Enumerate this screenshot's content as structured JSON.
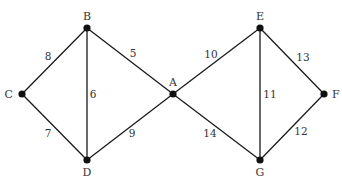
{
  "graph": {
    "nodes": [
      {
        "id": "A",
        "label": "A",
        "x": 173,
        "y": 94,
        "lx": 173,
        "ly": 86,
        "anchor": "middle"
      },
      {
        "id": "B",
        "label": "B",
        "x": 87,
        "y": 28,
        "lx": 87,
        "ly": 20,
        "anchor": "middle"
      },
      {
        "id": "C",
        "label": "C",
        "x": 22,
        "y": 94,
        "lx": 13,
        "ly": 98,
        "anchor": "end"
      },
      {
        "id": "D",
        "label": "D",
        "x": 87,
        "y": 160,
        "lx": 87,
        "ly": 176,
        "anchor": "middle"
      },
      {
        "id": "E",
        "label": "E",
        "x": 260,
        "y": 28,
        "lx": 260,
        "ly": 20,
        "anchor": "middle"
      },
      {
        "id": "F",
        "label": "F",
        "x": 324,
        "y": 94,
        "lx": 332,
        "ly": 98,
        "anchor": "start"
      },
      {
        "id": "G",
        "label": "G",
        "x": 260,
        "y": 160,
        "lx": 260,
        "ly": 176,
        "anchor": "middle"
      }
    ],
    "edges": [
      {
        "from": "C",
        "to": "B",
        "weight": "8",
        "wx": 48,
        "wy": 60
      },
      {
        "from": "B",
        "to": "A",
        "weight": "5",
        "wx": 133,
        "wy": 57
      },
      {
        "from": "B",
        "to": "D",
        "weight": "6",
        "wx": 93,
        "wy": 98
      },
      {
        "from": "C",
        "to": "D",
        "weight": "7",
        "wx": 48,
        "wy": 137
      },
      {
        "from": "D",
        "to": "A",
        "weight": "9",
        "wx": 132,
        "wy": 137
      },
      {
        "from": "A",
        "to": "E",
        "weight": "10",
        "wx": 211,
        "wy": 58
      },
      {
        "from": "E",
        "to": "G",
        "weight": "11",
        "wx": 270,
        "wy": 98
      },
      {
        "from": "E",
        "to": "F",
        "weight": "13",
        "wx": 303,
        "wy": 61
      },
      {
        "from": "A",
        "to": "G",
        "weight": "14",
        "wx": 210,
        "wy": 137
      },
      {
        "from": "G",
        "to": "F",
        "weight": "12",
        "wx": 301,
        "wy": 135
      }
    ]
  }
}
